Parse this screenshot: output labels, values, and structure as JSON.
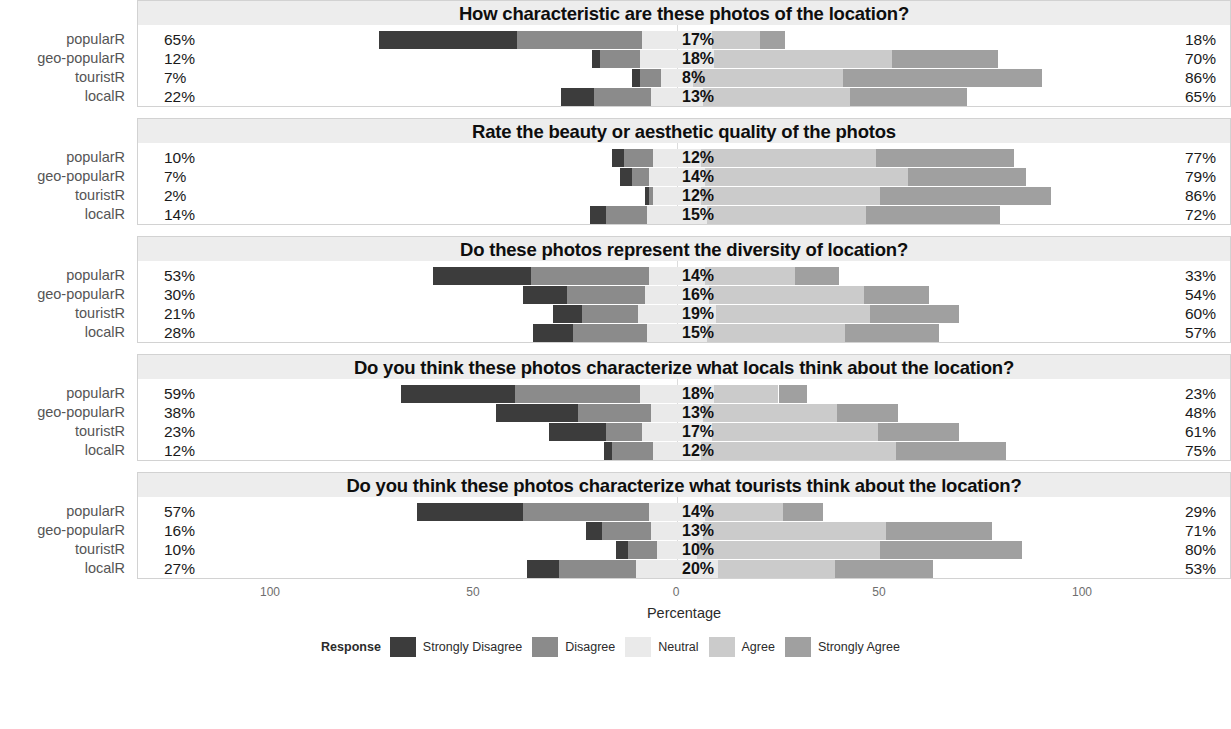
{
  "chart_data": {
    "type": "bar",
    "subtype": "diverging-stacked-likert",
    "title": "",
    "xlabel": "Percentage",
    "ylabel": "",
    "xticks": [
      "100",
      "50",
      "0",
      "50",
      "100"
    ],
    "xtick_values": [
      -100,
      -50,
      0,
      50,
      100
    ],
    "xlim": [
      -100,
      100
    ],
    "grid": false,
    "legend": {
      "title": "Response",
      "position": "bottom",
      "entries": [
        {
          "label": "Strongly Disagree",
          "color": "#3c3c3c"
        },
        {
          "label": "Disagree",
          "color": "#8b8b8b"
        },
        {
          "label": "Neutral",
          "color": "#eaeaea"
        },
        {
          "label": "Agree",
          "color": "#cbcbcb"
        },
        {
          "label": "Strongly Agree",
          "color": "#a0a0a0"
        }
      ]
    },
    "categories": [
      "popularR",
      "geo-popularR",
      "touristR",
      "localR"
    ],
    "series_names": [
      "Strongly Disagree",
      "Disagree",
      "Neutral",
      "Agree",
      "Strongly Agree"
    ],
    "panels": [
      {
        "title": "How characteristic are these photos of the location?",
        "rows": [
          {
            "category": "popularR",
            "values": [
              34,
              31,
              17,
              12,
              6
            ],
            "disagree_label": "65%",
            "neutral_label": "17%",
            "agree_label": "18%"
          },
          {
            "category": "geo-popularR",
            "values": [
              2,
              10,
              18,
              44,
              26
            ],
            "disagree_label": "12%",
            "neutral_label": "18%",
            "agree_label": "70%"
          },
          {
            "category": "touristR",
            "values": [
              2,
              5,
              8,
              37,
              49
            ],
            "disagree_label": "7%",
            "neutral_label": "8%",
            "agree_label": "86%"
          },
          {
            "category": "localR",
            "values": [
              8,
              14,
              13,
              36,
              29
            ],
            "disagree_label": "22%",
            "neutral_label": "13%",
            "agree_label": "65%"
          }
        ]
      },
      {
        "title": "Rate the beauty or aesthetic quality of the photos",
        "rows": [
          {
            "category": "popularR",
            "values": [
              3,
              7,
              12,
              43,
              34
            ],
            "disagree_label": "10%",
            "neutral_label": "12%",
            "agree_label": "77%"
          },
          {
            "category": "geo-popularR",
            "values": [
              3,
              4,
              14,
              50,
              29
            ],
            "disagree_label": "7%",
            "neutral_label": "14%",
            "agree_label": "79%"
          },
          {
            "category": "touristR",
            "values": [
              1,
              1,
              12,
              44,
              42
            ],
            "disagree_label": "2%",
            "neutral_label": "12%",
            "agree_label": "86%"
          },
          {
            "category": "localR",
            "values": [
              4,
              10,
              15,
              39,
              33
            ],
            "disagree_label": "14%",
            "neutral_label": "15%",
            "agree_label": "72%"
          }
        ]
      },
      {
        "title": "Do these photos represent the diversity of location?",
        "rows": [
          {
            "category": "popularR",
            "values": [
              24,
              29,
              14,
              22,
              11
            ],
            "disagree_label": "53%",
            "neutral_label": "14%",
            "agree_label": "33%"
          },
          {
            "category": "geo-popularR",
            "values": [
              11,
              19,
              16,
              38,
              16
            ],
            "disagree_label": "30%",
            "neutral_label": "16%",
            "agree_label": "54%"
          },
          {
            "category": "touristR",
            "values": [
              7,
              14,
              19,
              38,
              22
            ],
            "disagree_label": "21%",
            "neutral_label": "19%",
            "agree_label": "60%"
          },
          {
            "category": "localR",
            "values": [
              10,
              18,
              15,
              34,
              23
            ],
            "disagree_label": "28%",
            "neutral_label": "15%",
            "agree_label": "57%"
          }
        ]
      },
      {
        "title": "Do you think these photos characterize what locals think about the location?",
        "rows": [
          {
            "category": "popularR",
            "values": [
              28,
              31,
              18,
              16,
              7
            ],
            "disagree_label": "59%",
            "neutral_label": "18%",
            "agree_label": "23%"
          },
          {
            "category": "geo-popularR",
            "values": [
              20,
              18,
              13,
              33,
              15
            ],
            "disagree_label": "38%",
            "neutral_label": "13%",
            "agree_label": "48%"
          },
          {
            "category": "touristR",
            "values": [
              14,
              9,
              17,
              41,
              20
            ],
            "disagree_label": "23%",
            "neutral_label": "17%",
            "agree_label": "61%"
          },
          {
            "category": "localR",
            "values": [
              2,
              10,
              12,
              48,
              27
            ],
            "disagree_label": "12%",
            "neutral_label": "12%",
            "agree_label": "75%"
          }
        ]
      },
      {
        "title": "Do you think these photos characterize what tourists think about the location?",
        "rows": [
          {
            "category": "popularR",
            "values": [
              26,
              31,
              14,
              19,
              10
            ],
            "disagree_label": "57%",
            "neutral_label": "14%",
            "agree_label": "29%"
          },
          {
            "category": "geo-popularR",
            "values": [
              4,
              12,
              13,
              45,
              26
            ],
            "disagree_label": "16%",
            "neutral_label": "13%",
            "agree_label": "71%"
          },
          {
            "category": "touristR",
            "values": [
              3,
              7,
              10,
              45,
              35
            ],
            "disagree_label": "10%",
            "neutral_label": "10%",
            "agree_label": "80%"
          },
          {
            "category": "localR",
            "values": [
              8,
              19,
              20,
              29,
              24
            ],
            "disagree_label": "27%",
            "neutral_label": "20%",
            "agree_label": "53%"
          }
        ]
      }
    ]
  }
}
